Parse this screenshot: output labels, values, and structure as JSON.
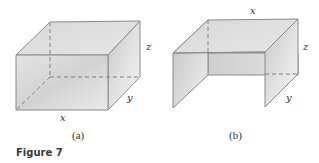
{
  "figure": {
    "caption": "Figure 7",
    "colors": {
      "edge": "#8a8a8a",
      "dashed": "#777777",
      "face_light": "#ececec",
      "face_mid": "#d6d6d6",
      "face_dark": "#bdbdbd"
    },
    "panels": [
      {
        "id": "a",
        "label": "(a)",
        "description": "Closed rectangular box",
        "dimension_labels": {
          "x": "x",
          "y": "y",
          "z": "z"
        }
      },
      {
        "id": "b",
        "label": "(b)",
        "description": "Open box with top and two sides, front and bottom open",
        "dimension_labels": {
          "x": "x",
          "y": "y",
          "z": "z"
        }
      }
    ]
  }
}
